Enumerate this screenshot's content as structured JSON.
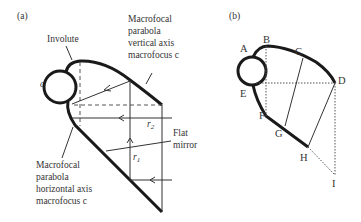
{
  "panel_a": {
    "label": "(a)",
    "involute_label": "Involute",
    "receiver_label": "c",
    "vertical_parabola_label": [
      "Macrofocal",
      "parabola",
      "vertical axis",
      "macrofocus c"
    ],
    "horizontal_parabola_label": [
      "Macrofocal",
      "parabola",
      "horizontal axis",
      "macrofocus c"
    ],
    "flat_mirror_label": [
      "Flat",
      "mirror"
    ],
    "r1_label": "r",
    "r1_sub": "1",
    "r2_label": "r",
    "r2_sub": "2"
  },
  "panel_b": {
    "label": "(b)",
    "points": [
      "A",
      "B",
      "C",
      "D",
      "E",
      "F",
      "G",
      "H",
      "I"
    ]
  },
  "colors": {
    "stroke": "#1a1a1a",
    "text": "#333333",
    "background": "#ffffff"
  }
}
